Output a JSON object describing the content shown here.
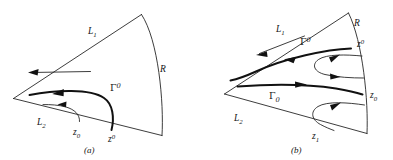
{
  "figure": {
    "type": "mathematical-diagram",
    "background_color": "#ffffff",
    "line_color": "#1a1a1a"
  },
  "panels": [
    {
      "id": "a",
      "caption": "(a)",
      "labels": {
        "boundary_upper": {
          "base": "L",
          "sub": "1"
        },
        "boundary_lower": {
          "base": "L",
          "sub": "2"
        },
        "arc": {
          "base": "R",
          "sub": ""
        },
        "contour_gamma": {
          "base": "Γ",
          "sup": "0"
        },
        "point_z_sub": {
          "base": "z",
          "sub": "0"
        },
        "point_z_sup": {
          "base": "z",
          "sup": "0"
        }
      }
    },
    {
      "id": "b",
      "caption": "(b)",
      "labels": {
        "boundary_upper": {
          "base": "L",
          "sub": "1"
        },
        "boundary_lower": {
          "base": "L",
          "sub": "2"
        },
        "arc": {
          "base": "R",
          "sub": ""
        },
        "contour_gamma_sup": {
          "base": "Γ",
          "sup": "0"
        },
        "contour_gamma_sub": {
          "base": "Γ",
          "sub": "0"
        },
        "point_z_sup": {
          "base": "z",
          "sup": "0"
        },
        "point_z_sub": {
          "base": "z",
          "sub": "0"
        },
        "point_z_one": {
          "base": "z",
          "sub": "1"
        }
      }
    }
  ]
}
